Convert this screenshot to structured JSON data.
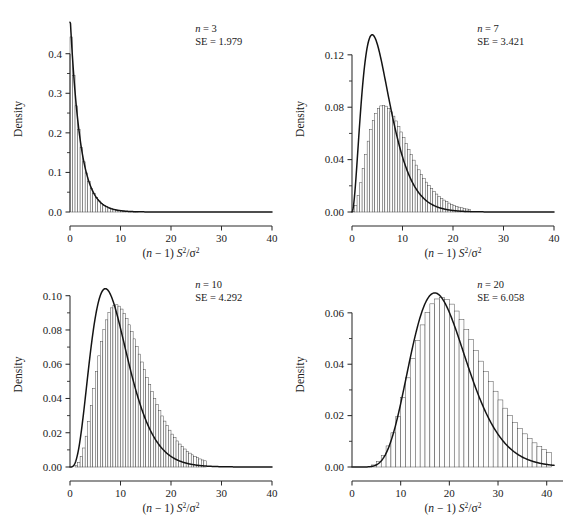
{
  "figure": {
    "background": "#ffffff",
    "ink": "#1a1a1a",
    "axis_color": "#2b2b2b",
    "curve_color": "#141414",
    "bar_fill": "#fdfdfd",
    "bar_stroke": "#3a3a3a"
  },
  "labels": {
    "ylabel": "Density",
    "xlabel_parts": {
      "open": "(",
      "n": "n",
      "minus_one": " − 1) ",
      "S": "S",
      "sup2_a": "2",
      "slash": "/",
      "sigma": "σ",
      "sup2_b": "2"
    },
    "xlabel_plain": "(n − 1) S²/σ²",
    "n_symbol": "n",
    "se_symbol": "SE",
    "equals": "="
  },
  "chart_data": [
    {
      "type": "histogram",
      "panel": "top-left",
      "title": "",
      "xlabel": "(n − 1) S²/σ²",
      "ylabel": "Density",
      "annotation": {
        "n_label": "n = 3",
        "n_value": 3,
        "se_label": "SE = 1.979",
        "se_value": 1.979
      },
      "df": 2,
      "xlim": [
        0,
        40
      ],
      "ylim": [
        0,
        0.47
      ],
      "xticks": [
        0,
        10,
        20,
        30,
        40
      ],
      "xticklabels": [
        "0",
        "10",
        "20",
        "30",
        "40"
      ],
      "yticks": [
        0.0,
        0.1,
        0.2,
        0.3,
        0.4
      ],
      "yticklabels": [
        "0.0",
        "0.1",
        "0.2",
        "0.3",
        "0.4"
      ],
      "grid": false,
      "legend": "none",
      "bin_width": 0.5,
      "bin_centers": [
        0.25,
        0.75,
        1.25,
        1.75,
        2.25,
        2.75,
        3.25,
        3.75,
        4.25,
        4.75,
        5.25,
        5.75,
        6.25,
        6.75,
        7.25,
        7.75,
        8.25,
        8.75,
        9.25,
        9.75,
        10.25,
        10.75,
        11.25,
        11.75,
        12.25,
        12.75,
        13.25,
        13.75,
        14.25,
        14.75,
        15.25,
        15.75,
        16.25,
        16.75,
        17.25,
        17.75,
        18.25,
        18.75,
        19.25,
        19.75
      ],
      "bin_heights": [
        0.4424,
        0.3446,
        0.2684,
        0.209,
        0.1628,
        0.1268,
        0.0987,
        0.0769,
        0.0599,
        0.0466,
        0.0363,
        0.0283,
        0.022,
        0.0172,
        0.0134,
        0.0104,
        0.0081,
        0.0063,
        0.0049,
        0.0038,
        0.003,
        0.0023,
        0.0018,
        0.0014,
        0.0011,
        0.0009,
        0.0007,
        0.0005,
        0.0004,
        0.0003,
        0.0002,
        0.0002,
        0.0002,
        0.0001,
        0.0001,
        0.0001,
        0.0001,
        0.0,
        0.0,
        0.0
      ],
      "curve_peak_x": 0.0,
      "curve_peak_y": 0.47
    },
    {
      "type": "histogram",
      "panel": "top-right",
      "title": "",
      "xlabel": "(n − 1) S²/σ²",
      "ylabel": "Density",
      "annotation": {
        "n_label": "n = 7",
        "n_value": 7,
        "se_label": "SE = 3.421",
        "se_value": 3.421
      },
      "df": 6,
      "xlim": [
        0,
        40
      ],
      "ylim": [
        0,
        0.142
      ],
      "xticks": [
        0,
        10,
        20,
        30,
        40
      ],
      "xticklabels": [
        "0",
        "10",
        "20",
        "30",
        "40"
      ],
      "yticks": [
        0.0,
        0.04,
        0.08,
        0.12
      ],
      "yticklabels": [
        "0.00",
        "0.04",
        "0.08",
        "0.12"
      ],
      "yminorticks": [
        0.02,
        0.06,
        0.1,
        0.14
      ],
      "grid": false,
      "legend": "none",
      "bin_width": 0.5,
      "bin_centers": [
        0.25,
        0.75,
        1.25,
        1.75,
        2.25,
        2.75,
        3.25,
        3.75,
        4.25,
        4.75,
        5.25,
        5.75,
        6.25,
        6.75,
        7.25,
        7.75,
        8.25,
        8.75,
        9.25,
        9.75,
        10.25,
        10.75,
        11.25,
        11.75,
        12.25,
        12.75,
        13.25,
        13.75,
        14.25,
        14.75,
        15.25,
        15.75,
        16.25,
        16.75,
        17.25,
        17.75,
        18.25,
        18.75,
        19.25,
        19.75,
        20.25,
        20.75,
        21.25,
        21.75,
        22.25,
        22.75,
        23.25
      ],
      "bin_heights": [
        0.0006,
        0.0049,
        0.0124,
        0.0223,
        0.0331,
        0.044,
        0.0541,
        0.0629,
        0.07,
        0.0754,
        0.079,
        0.081,
        0.0815,
        0.0808,
        0.0791,
        0.0765,
        0.0732,
        0.0695,
        0.0654,
        0.0611,
        0.0567,
        0.0523,
        0.0479,
        0.0437,
        0.0396,
        0.0358,
        0.0322,
        0.0288,
        0.0257,
        0.0228,
        0.0202,
        0.0178,
        0.0157,
        0.0137,
        0.012,
        0.0104,
        0.0091,
        0.0079,
        0.0068,
        0.0059,
        0.0051,
        0.0044,
        0.0037,
        0.0032,
        0.0027,
        0.0023,
        0.002
      ],
      "curve_peak_x": 4.0,
      "curve_peak_y": 0.1353
    },
    {
      "type": "histogram",
      "panel": "bottom-left",
      "title": "",
      "xlabel": "(n − 1) S²/σ²",
      "ylabel": "Density",
      "annotation": {
        "n_label": "n = 10",
        "n_value": 10,
        "se_label": "SE = 4.292",
        "se_value": 4.292
      },
      "df": 9,
      "xlim": [
        0,
        40
      ],
      "ylim": [
        0,
        0.108
      ],
      "xticks": [
        0,
        10,
        20,
        30,
        40
      ],
      "xticklabels": [
        "0",
        "10",
        "20",
        "30",
        "40"
      ],
      "yticks": [
        0.0,
        0.02,
        0.04,
        0.06,
        0.08,
        0.1
      ],
      "yticklabels": [
        "0.00",
        "0.02",
        "0.04",
        "0.06",
        "0.08",
        "0.10"
      ],
      "grid": false,
      "legend": "none",
      "bin_width": 0.5,
      "bin_centers": [
        1.25,
        1.75,
        2.25,
        2.75,
        3.25,
        3.75,
        4.25,
        4.75,
        5.25,
        5.75,
        6.25,
        6.75,
        7.25,
        7.75,
        8.25,
        8.75,
        9.25,
        9.75,
        10.25,
        10.75,
        11.25,
        11.75,
        12.25,
        12.75,
        13.25,
        13.75,
        14.25,
        14.75,
        15.25,
        15.75,
        16.25,
        16.75,
        17.25,
        17.75,
        18.25,
        18.75,
        19.25,
        19.75,
        20.25,
        20.75,
        21.25,
        21.75,
        22.25,
        22.75,
        23.25,
        23.75,
        24.25,
        24.75,
        25.25,
        25.75,
        26.25,
        26.75
      ],
      "bin_heights": [
        0.0009,
        0.0027,
        0.006,
        0.0111,
        0.018,
        0.0265,
        0.036,
        0.0459,
        0.0557,
        0.0649,
        0.0732,
        0.0802,
        0.0859,
        0.0901,
        0.0929,
        0.0944,
        0.0947,
        0.0939,
        0.0922,
        0.0897,
        0.0866,
        0.083,
        0.079,
        0.0748,
        0.0704,
        0.0659,
        0.0613,
        0.0568,
        0.0524,
        0.0481,
        0.044,
        0.0401,
        0.0364,
        0.033,
        0.0298,
        0.0268,
        0.0241,
        0.0215,
        0.0192,
        0.0171,
        0.0152,
        0.0134,
        0.0119,
        0.0105,
        0.0092,
        0.0081,
        0.0071,
        0.0062,
        0.0054,
        0.0047,
        0.0041,
        0.0036
      ],
      "curve_peak_x": 7.0,
      "curve_peak_y": 0.1033
    },
    {
      "type": "histogram",
      "panel": "bottom-right",
      "title": "",
      "xlabel": "(n − 1) S²/σ²",
      "ylabel": "Density",
      "annotation": {
        "n_label": "n = 20",
        "n_value": 20,
        "se_label": "SE = 6.058",
        "se_value": 6.058
      },
      "df": 19,
      "xlim": [
        0,
        41.5
      ],
      "ylim": [
        0,
        0.072
      ],
      "xticks": [
        0,
        10,
        20,
        30,
        40
      ],
      "xticklabels": [
        "0",
        "10",
        "20",
        "30",
        "40"
      ],
      "yticks": [
        0.0,
        0.02,
        0.04,
        0.06
      ],
      "yticklabels": [
        "0.00",
        "0.02",
        "0.04",
        "0.06"
      ],
      "yminorticks": [
        0.01,
        0.03,
        0.05,
        0.07
      ],
      "grid": false,
      "legend": "none",
      "bin_width": 1.0,
      "bin_centers": [
        4.5,
        5.5,
        6.5,
        7.5,
        8.5,
        9.5,
        10.5,
        11.5,
        12.5,
        13.5,
        14.5,
        15.5,
        16.5,
        17.5,
        18.5,
        19.5,
        20.5,
        21.5,
        22.5,
        23.5,
        24.5,
        25.5,
        26.5,
        27.5,
        28.5,
        29.5,
        30.5,
        31.5,
        32.5,
        33.5,
        34.5,
        35.5,
        36.5,
        37.5,
        38.5,
        39.5,
        40.5
      ],
      "bin_heights": [
        0.0008,
        0.0021,
        0.0045,
        0.0082,
        0.0133,
        0.0197,
        0.027,
        0.0347,
        0.0423,
        0.0493,
        0.0553,
        0.0601,
        0.0635,
        0.0654,
        0.0659,
        0.0652,
        0.0634,
        0.0607,
        0.0574,
        0.0536,
        0.0496,
        0.0454,
        0.0412,
        0.0371,
        0.0332,
        0.0295,
        0.0261,
        0.0229,
        0.02,
        0.0174,
        0.015,
        0.0129,
        0.0111,
        0.0094,
        0.008,
        0.0068,
        0.0057
      ],
      "curve_peak_x": 17.0,
      "curve_peak_y": 0.0686
    }
  ]
}
